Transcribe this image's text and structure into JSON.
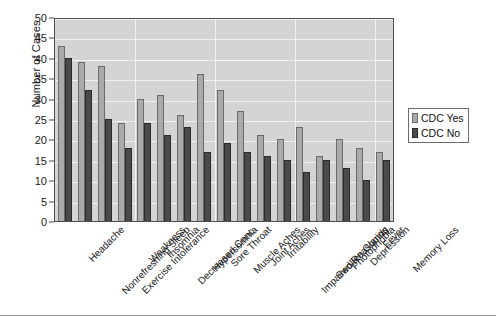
{
  "chart_data": {
    "type": "bar",
    "title": "",
    "xlabel": "",
    "ylabel": "Number of Cases",
    "ylim": [
      0,
      50
    ],
    "ytick_step": 5,
    "yticks": [
      "0",
      "5",
      "10",
      "15",
      "20",
      "25",
      "30",
      "35",
      "40",
      "45",
      "50"
    ],
    "grid": true,
    "legend_position": "right",
    "categories": [
      "Headache",
      "Nonrefreshing Sleep",
      "Exercise Intolerance",
      "Weakness",
      "Insomnia",
      "Decreased Conc.",
      "Hypersomnia",
      "Sore Throat",
      "Muscle Aches",
      "Joint Aches",
      "Irritability",
      "Impaired Reasoning",
      "Swollen Glands",
      "Photophobia",
      "Depression",
      "Fever",
      "Memory Loss"
    ],
    "series": [
      {
        "name": "CDC Yes",
        "color": "#aaaaaa",
        "values": [
          43,
          39,
          38,
          24,
          30,
          31,
          26,
          36,
          32,
          27,
          21,
          20,
          23,
          16,
          20,
          18,
          17
        ]
      },
      {
        "name": "CDC No",
        "color": "#4a4a4a",
        "values": [
          40,
          32,
          25,
          18,
          24,
          21,
          23,
          17,
          19,
          17,
          16,
          15,
          12,
          15,
          13,
          10,
          15
        ]
      }
    ]
  },
  "legend": {
    "items": [
      {
        "label": "CDC Yes",
        "swatch": "light-gray-swatch"
      },
      {
        "label": "CDC No",
        "swatch": "dark-gray-swatch"
      }
    ]
  },
  "axes": {
    "y_title": "Number of Cases"
  }
}
